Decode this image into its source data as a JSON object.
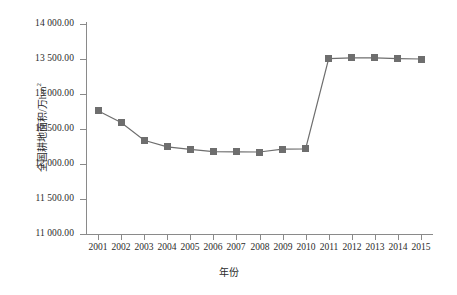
{
  "chart_data": {
    "type": "line",
    "title": "",
    "xlabel": "年份",
    "ylabel": "全国耕地面积/万hm²",
    "ylabel_main": "全国耕地面积/万hm",
    "ylabel_sup": "2",
    "categories": [
      "2001",
      "2002",
      "2003",
      "2004",
      "2005",
      "2006",
      "2007",
      "2008",
      "2009",
      "2010",
      "2011",
      "2012",
      "2013",
      "2014",
      "2015"
    ],
    "values": [
      12761.58,
      12593.0,
      12339.22,
      12244.43,
      12208.27,
      12177.59,
      12173.52,
      12171.59,
      12211.18,
      12216.71,
      13505.73,
      13515.85,
      13516.34,
      13505.74,
      13499.87
    ],
    "series": [
      {
        "name": "全国耕地面积",
        "values": [
          12761.58,
          12593.0,
          12339.22,
          12244.43,
          12208.27,
          12177.59,
          12173.52,
          12171.59,
          12211.18,
          12216.71,
          13505.73,
          13515.85,
          13516.34,
          13505.74,
          13499.87
        ]
      }
    ],
    "ylim": [
      11000,
      14000
    ],
    "ytick_values": [
      11000,
      11500,
      12000,
      12500,
      13000,
      13500,
      14000
    ],
    "ytick_labels": [
      "11 000.00",
      "11 500.00",
      "12 000.00",
      "12 500.00",
      "13 000.00",
      "13 500.00",
      "14 000.00"
    ],
    "grid": false,
    "legend": "none",
    "line_color": "#6e6e6e",
    "marker_color": "#6e6e6e",
    "marker_shape": "square",
    "axis_color": "#8a8a8a"
  }
}
